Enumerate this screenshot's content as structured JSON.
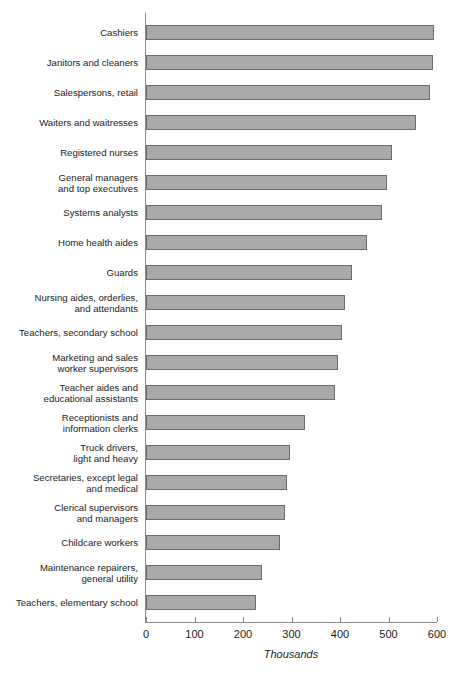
{
  "chart_data": {
    "type": "bar",
    "orientation": "horizontal",
    "title": "",
    "xlabel": "Thousands",
    "ylabel": "",
    "xlim": [
      0,
      600
    ],
    "xticks": [
      0,
      100,
      200,
      300,
      400,
      500,
      600
    ],
    "grid": false,
    "legend": null,
    "bar_color": "#a9a9a9",
    "bar_border_color": "#6d6d6d",
    "categories": [
      "Cashiers",
      "Janitors and cleaners",
      "Salespersons, retail",
      "Waiters and waitresses",
      "Registered nurses",
      "General managers\nand top executives",
      "Systems analysts",
      "Home health aides",
      "Guards",
      "Nursing aides, orderlies,\nand attendants",
      "Teachers, secondary school",
      "Marketing and sales\nworker supervisors",
      "Teacher aides and\neducational assistants",
      "Receptionists and\ninformation clerks",
      "Truck drivers,\nlight and heavy",
      "Secretaries, except legal\nand medical",
      "Clerical supervisors\nand managers",
      "Childcare workers",
      "Maintenance repairers,\ngeneral utility",
      "Teachers, elementary school"
    ],
    "values": [
      594,
      592,
      586,
      556,
      508,
      497,
      487,
      456,
      425,
      411,
      405,
      396,
      389,
      328,
      296,
      291,
      287,
      276,
      239,
      227
    ]
  },
  "axis": {
    "tick_labels": [
      "0",
      "100",
      "200",
      "300",
      "400",
      "500",
      "600"
    ],
    "unit_label": "Thousands"
  }
}
